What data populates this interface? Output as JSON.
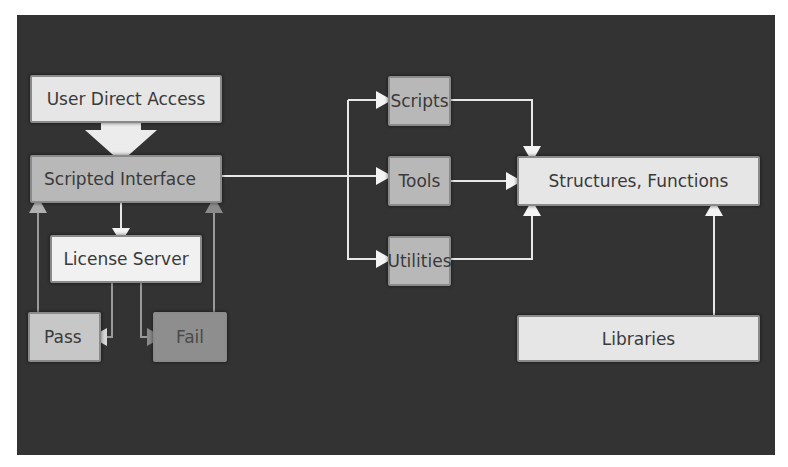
{
  "diagram": {
    "type": "flowchart",
    "background_color": "#333333",
    "nodes": {
      "user_direct_access": "User Direct Access",
      "scripted_interface": "Scripted Interface",
      "license_server": "License Server",
      "pass": "Pass",
      "fail": "Fail",
      "scripts": "Scripts",
      "tools": "Tools",
      "utilities": "Utilities",
      "structures_functions": "Structures, Functions",
      "libraries": "Libraries"
    },
    "edges": [
      {
        "from": "User Direct Access",
        "to": "Scripted Interface",
        "style": "block-arrow"
      },
      {
        "from": "Scripted Interface",
        "to": "License Server"
      },
      {
        "from": "License Server",
        "to": "Pass"
      },
      {
        "from": "License Server",
        "to": "Fail"
      },
      {
        "from": "Pass",
        "to": "Scripted Interface"
      },
      {
        "from": "Fail",
        "to": "Scripted Interface"
      },
      {
        "from": "Scripted Interface",
        "to": "Scripts"
      },
      {
        "from": "Scripted Interface",
        "to": "Tools"
      },
      {
        "from": "Scripted Interface",
        "to": "Utilities"
      },
      {
        "from": "Scripts",
        "to": "Structures, Functions"
      },
      {
        "from": "Tools",
        "to": "Structures, Functions"
      },
      {
        "from": "Utilities",
        "to": "Structures, Functions"
      },
      {
        "from": "Libraries",
        "to": "Structures, Functions"
      }
    ]
  }
}
